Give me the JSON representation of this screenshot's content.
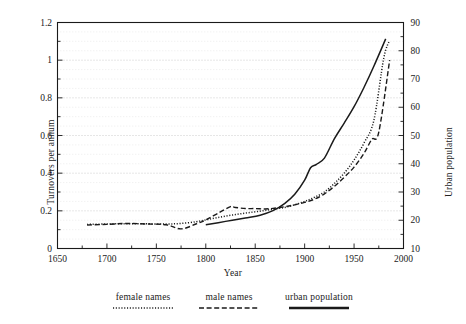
{
  "chart_data": {
    "type": "line",
    "title": "",
    "xlabel": "Year",
    "ylabel": "Turnovers per annum",
    "y2label": "Urban population",
    "xlim": [
      1650,
      2000
    ],
    "ylim": [
      0,
      1.2
    ],
    "y2lim": [
      10,
      90
    ],
    "grid": true,
    "legend_position": "bottom",
    "xticks": [
      "1650",
      "1700",
      "1750",
      "1800",
      "1850",
      "1900",
      "1950",
      "2000"
    ],
    "xtick_values": [
      1650,
      1700,
      1750,
      1800,
      1850,
      1900,
      1950,
      2000
    ],
    "yticks": [
      "0",
      "0.2",
      "0.4",
      "0.6",
      "0.8",
      "1",
      "1.2"
    ],
    "ytick_values": [
      0,
      0.2,
      0.4,
      0.6,
      0.8,
      1.0,
      1.2
    ],
    "y2ticks": [
      "10",
      "20",
      "30",
      "40",
      "50",
      "60",
      "70",
      "80",
      "90"
    ],
    "y2tick_values": [
      10,
      20,
      30,
      40,
      50,
      60,
      70,
      80,
      90
    ],
    "series": [
      {
        "name": "female names",
        "style": "dotted",
        "axis": "left",
        "color": "#1a1a1a",
        "x": [
          1680,
          1700,
          1720,
          1740,
          1760,
          1775,
          1790,
          1800,
          1810,
          1820,
          1830,
          1840,
          1850,
          1860,
          1870,
          1880,
          1890,
          1900,
          1910,
          1920,
          1930,
          1940,
          1950,
          1960,
          1970,
          1980,
          1986
        ],
        "values": [
          0.128,
          0.13,
          0.132,
          0.131,
          0.13,
          0.133,
          0.142,
          0.152,
          0.162,
          0.172,
          0.18,
          0.188,
          0.195,
          0.202,
          0.21,
          0.218,
          0.232,
          0.25,
          0.272,
          0.3,
          0.345,
          0.4,
          0.47,
          0.56,
          0.68,
          1.01,
          1.105
        ]
      },
      {
        "name": "male names",
        "style": "dashed",
        "axis": "left",
        "color": "#1a1a1a",
        "x": [
          1680,
          1700,
          1720,
          1740,
          1760,
          1775,
          1790,
          1800,
          1812,
          1825,
          1830,
          1840,
          1850,
          1860,
          1868,
          1880,
          1890,
          1900,
          1910,
          1920,
          1930,
          1940,
          1950,
          1960,
          1968,
          1975,
          1986
        ],
        "values": [
          0.125,
          0.128,
          0.133,
          0.13,
          0.126,
          0.104,
          0.13,
          0.152,
          0.186,
          0.222,
          0.218,
          0.212,
          0.212,
          0.21,
          0.213,
          0.222,
          0.232,
          0.245,
          0.262,
          0.29,
          0.33,
          0.378,
          0.432,
          0.505,
          0.58,
          0.618,
          1.0
        ]
      },
      {
        "name": "urban population",
        "style": "solid",
        "axis": "right",
        "color": "#1a1a1a",
        "x": [
          1800,
          1820,
          1840,
          1855,
          1868,
          1880,
          1890,
          1900,
          1906,
          1912,
          1920,
          1930,
          1940,
          1950,
          1960,
          1970,
          1982
        ],
        "values": [
          18.4,
          19.6,
          20.8,
          21.8,
          23.4,
          26.0,
          29.2,
          34.2,
          38.6,
          39.8,
          42.0,
          48.8,
          54.4,
          60.2,
          67.0,
          74.5,
          84.2
        ]
      }
    ]
  },
  "legend": {
    "entries": [
      {
        "label": "female names",
        "style": "dotted"
      },
      {
        "label": "male names",
        "style": "dashed"
      },
      {
        "label": "urban population",
        "style": "solid"
      }
    ]
  }
}
